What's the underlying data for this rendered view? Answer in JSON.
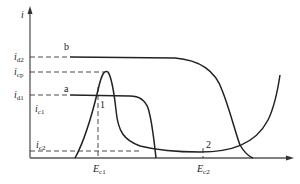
{
  "diagram": {
    "type": "current-potential curves",
    "y_axis_label": "i",
    "x_axis_label": "",
    "y_ticks": [
      {
        "main": "i",
        "sub": "d2"
      },
      {
        "main": "i",
        "sub": "cp"
      },
      {
        "main": "i",
        "sub": "d1"
      },
      {
        "main": "i",
        "sub": "c1"
      },
      {
        "main": "i",
        "sub": "c2"
      }
    ],
    "x_ticks": [
      {
        "main": "E",
        "sub": "c1"
      },
      {
        "main": "E",
        "sub": "c2"
      }
    ],
    "curve_labels": {
      "a": "a",
      "b": "b"
    },
    "point_labels": {
      "p1": "1",
      "p2": "2"
    },
    "colors": {
      "line": "#222222",
      "dashed": "#333333",
      "axis": "#555555"
    }
  }
}
